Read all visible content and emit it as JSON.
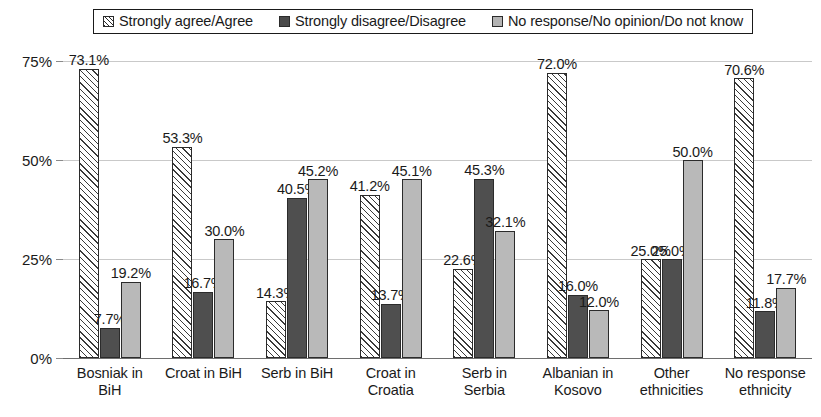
{
  "legend": {
    "position": "top",
    "entries": [
      {
        "label": "Strongly agree/Agree",
        "swatch": "hatch-pattern-swatch",
        "color": "#ffffff"
      },
      {
        "label": "Strongly disagree/Disagree",
        "swatch": "dark-gray-swatch",
        "color": "#4f4f4f"
      },
      {
        "label": "No response/No opinion/Do not know",
        "swatch": "light-gray-swatch",
        "color": "#b9b9b9"
      }
    ]
  },
  "yaxis": {
    "ticks": [
      "75%",
      "50%",
      "25%",
      "0%"
    ],
    "values": [
      75,
      50,
      25,
      0
    ]
  },
  "chart_data": {
    "type": "bar",
    "title": "",
    "subtitle": "",
    "xlabel": "",
    "ylabel": "",
    "ylim": [
      0,
      75
    ],
    "yticks": [
      0,
      25,
      50,
      75
    ],
    "ytick_labels": [
      "0%",
      "25%",
      "50%",
      "75%"
    ],
    "grid": true,
    "legend_position": "top",
    "value_label_suffix": "%",
    "categories": [
      "Bosniak in BiH",
      "Croat in BiH",
      "Serb in BiH",
      "Croat in Croatia",
      "Serb in Serbia",
      "Albanian in Kosovo",
      "Other ethnicities",
      "No response ethnicity"
    ],
    "category_lines": [
      [
        "Bosniak in",
        "BiH"
      ],
      [
        "Croat in BiH"
      ],
      [
        "Serb in BiH"
      ],
      [
        "Croat in",
        "Croatia"
      ],
      [
        "Serb in",
        "Serbia"
      ],
      [
        "Albanian in",
        "Kosovo"
      ],
      [
        "Other",
        "ethnicities"
      ],
      [
        "No response",
        "ethnicity"
      ]
    ],
    "series": [
      {
        "name": "Strongly agree/Agree",
        "color": "#ffffff",
        "pattern": "diagonal-hatch",
        "values": [
          73.1,
          53.3,
          14.3,
          41.2,
          22.6,
          72.0,
          25.0,
          70.6
        ],
        "labels": [
          "73.1%",
          "53.3%",
          "14.3%",
          "41.2%",
          "22.6%",
          "72.0%",
          "25.0%",
          "70.6%"
        ]
      },
      {
        "name": "Strongly disagree/Disagree",
        "color": "#4f4f4f",
        "pattern": "solid",
        "values": [
          7.7,
          16.7,
          40.5,
          13.7,
          45.3,
          16.0,
          25.0,
          11.8
        ],
        "labels": [
          "7.7%",
          "16.7%",
          "40.5%",
          "13.7%",
          "45.3%",
          "16.0%",
          "25.0%",
          "11.8%"
        ]
      },
      {
        "name": "No response/No opinion/Do not know",
        "color": "#b9b9b9",
        "pattern": "solid",
        "values": [
          19.2,
          30.0,
          45.2,
          45.1,
          32.1,
          12.0,
          50.0,
          17.7
        ],
        "labels": [
          "19.2%",
          "30.0%",
          "45.2%",
          "45.1%",
          "32.1%",
          "12.0%",
          "50.0%",
          "17.7%"
        ]
      }
    ]
  }
}
